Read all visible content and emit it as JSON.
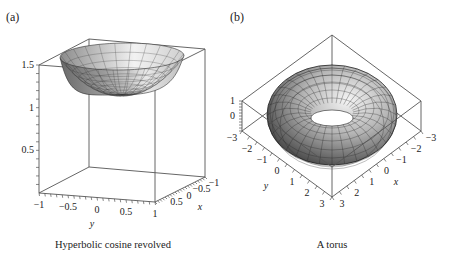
{
  "chart_data": [
    {
      "type": "surface3d",
      "panel_label": "(a)",
      "caption": "Hyperbolic cosine revolved",
      "surface": "z = cosh(sqrt(x^2 + y^2)) revolved",
      "xlabel": "x",
      "ylabel": "y",
      "zlabel": "",
      "xlim": [
        -1,
        1
      ],
      "ylim": [
        -1,
        1
      ],
      "zlim": [
        0,
        1.5
      ],
      "x_ticks": [
        "-1",
        "-0.5",
        "0",
        "0.5"
      ],
      "y_ticks": [
        "-1",
        "-0.5",
        "0",
        "0.5",
        "1"
      ],
      "z_ticks": [
        "0.5",
        "1",
        "1.5"
      ],
      "box": true
    },
    {
      "type": "surface3d",
      "panel_label": "(b)",
      "caption": "A torus",
      "surface": "torus",
      "xlabel": "x",
      "ylabel": "y",
      "zlabel": "",
      "xlim": [
        -3,
        3
      ],
      "ylim": [
        -3,
        3
      ],
      "zlim": [
        -1,
        1
      ],
      "x_ticks": [
        "-3",
        "-2",
        "-1",
        "0",
        "1",
        "2",
        "3"
      ],
      "y_ticks": [
        "-3",
        "-2",
        "-1",
        "0",
        "1",
        "2",
        "3"
      ],
      "z_ticks": [
        "1",
        "0"
      ],
      "box": true
    }
  ]
}
